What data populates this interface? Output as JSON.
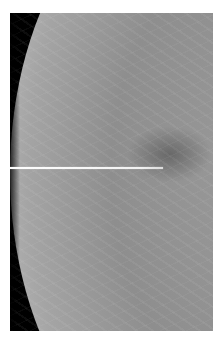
{
  "image": {
    "type": "mammogram",
    "description": "Grayscale breast X-ray with a thin bright localization wire/needle entering horizontally from the left edge",
    "colors": {
      "background": "#000000",
      "tissue": "#9a9a9a",
      "border": "#ffffff",
      "needle": "#ffffff"
    }
  }
}
